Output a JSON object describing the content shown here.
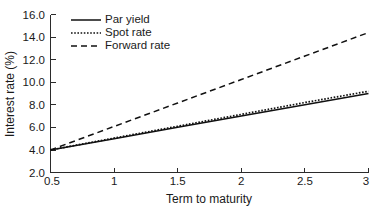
{
  "chart_data": {
    "type": "line",
    "title": "",
    "xlabel": "Term to maturity",
    "ylabel": "Interest rate (%)",
    "xlim": [
      0.5,
      3
    ],
    "ylim": [
      2.0,
      16.0
    ],
    "grid": false,
    "legend_position": "top-left",
    "xticks": [
      "0.5",
      "1",
      "1.5",
      "2",
      "2.5",
      "3"
    ],
    "xtick_values": [
      0.5,
      1,
      1.5,
      2,
      2.5,
      3
    ],
    "yticks": [
      "2.0",
      "4.0",
      "6.0",
      "8.0",
      "10.0",
      "12.0",
      "14.0",
      "16.0"
    ],
    "ytick_values": [
      2.0,
      4.0,
      6.0,
      8.0,
      10.0,
      12.0,
      14.0,
      16.0
    ],
    "x": [
      0.5,
      1.0,
      1.5,
      2.0,
      2.5,
      3.0
    ],
    "series": [
      {
        "name": "Par yield",
        "style": "solid",
        "color": "#111111",
        "values": [
          4.0,
          5.0,
          6.0,
          7.0,
          8.0,
          9.0
        ]
      },
      {
        "name": "Spot rate",
        "style": "dotted",
        "color": "#111111",
        "values": [
          4.0,
          5.05,
          6.1,
          7.15,
          8.2,
          9.2
        ]
      },
      {
        "name": "Forward rate",
        "style": "dashed",
        "color": "#111111",
        "values": [
          4.0,
          6.08,
          8.16,
          10.24,
          12.32,
          14.4
        ]
      }
    ]
  },
  "legend": {
    "items": [
      {
        "label": "Par yield"
      },
      {
        "label": "Spot rate"
      },
      {
        "label": "Forward rate"
      }
    ]
  }
}
